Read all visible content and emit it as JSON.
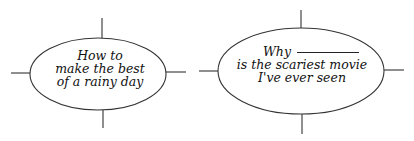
{
  "colors": {
    "background": "#ffffff",
    "stroke": "#333333",
    "text": "#111111"
  },
  "maps": [
    {
      "id": "left",
      "center": {
        "x": 98,
        "y": 74
      },
      "rx": 68,
      "ry": 36,
      "lines": [
        "How to",
        "make the best",
        "of a rainy day"
      ],
      "spokes": {
        "top": {
          "x1": 102,
          "y1": 18,
          "x2": 102,
          "y2": 38
        },
        "bottom": {
          "x1": 103,
          "y1": 110,
          "x2": 103,
          "y2": 128
        },
        "left": {
          "x1": 11,
          "y1": 73,
          "x2": 30,
          "y2": 73
        },
        "right": {
          "x1": 167,
          "y1": 72,
          "x2": 186,
          "y2": 72
        }
      }
    },
    {
      "id": "right",
      "center": {
        "x": 301,
        "y": 71
      },
      "rx": 83,
      "ry": 43,
      "lines": [
        "Why",
        "is the scariest movie",
        "I've ever seen"
      ],
      "has_blank_after_first_word": true,
      "spokes": {
        "top": {
          "x1": 301,
          "y1": 10,
          "x2": 301,
          "y2": 30
        },
        "bottom": {
          "x1": 302,
          "y1": 115,
          "x2": 302,
          "y2": 134
        },
        "left": {
          "x1": 199,
          "y1": 71,
          "x2": 218,
          "y2": 71
        },
        "right": {
          "x1": 385,
          "y1": 70,
          "x2": 404,
          "y2": 70
        }
      }
    }
  ]
}
